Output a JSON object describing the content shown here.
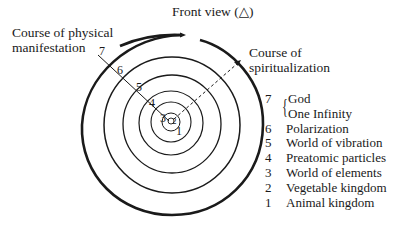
{
  "title": "Front view (△)",
  "labels": {
    "physical_manifestation": [
      "Course of physical",
      "manifestation"
    ],
    "spiritualization": [
      "Course of",
      "spiritualization"
    ]
  },
  "spiral_numbers": [
    "7",
    "6",
    "5",
    "4",
    "3",
    "2",
    "1"
  ],
  "legend": [
    {
      "num": "7",
      "lines": [
        "God",
        "One Infinity"
      ]
    },
    {
      "num": "6",
      "label": "Polarization"
    },
    {
      "num": "5",
      "label": "World of vibration"
    },
    {
      "num": "4",
      "label": "Preatomic particles"
    },
    {
      "num": "3",
      "label": "World of elements"
    },
    {
      "num": "2",
      "label": "Vegetable kingdom"
    },
    {
      "num": "1",
      "label": "Animal kingdom"
    }
  ],
  "colors": {
    "ink": "#1a1a1a",
    "background": "#ffffff"
  }
}
